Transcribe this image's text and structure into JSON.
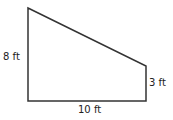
{
  "diagram": {
    "shape": "right trapezoid",
    "labels": {
      "left_side": "8 ft",
      "right_side": "3 ft",
      "bottom_side": "10 ft"
    },
    "stroke_color": "#333333"
  }
}
